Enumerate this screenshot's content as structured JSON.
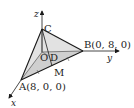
{
  "figure": {
    "axes": {
      "x": "x",
      "y": "y",
      "z": "z"
    },
    "points": {
      "C": {
        "label": "C"
      },
      "O": {
        "label": "O"
      },
      "D": {
        "label": "D"
      },
      "M": {
        "label": "M"
      },
      "A": {
        "label": "A(8, 0, 0)"
      },
      "B": {
        "label": "B(0, 8, 0)"
      }
    },
    "colors": {
      "stroke": "#1a1a1a",
      "fill": "#d9d9d9",
      "background": "#ffffff"
    }
  }
}
